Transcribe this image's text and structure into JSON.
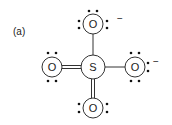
{
  "figure": {
    "label": "(a)",
    "molecule": "sulfate Lewis structure",
    "central_atom": {
      "symbol": "S"
    },
    "atoms": [
      {
        "position": "top",
        "symbol": "O",
        "bond": "single",
        "lone_pair_dots": 6,
        "charge": "−"
      },
      {
        "position": "left",
        "symbol": "O",
        "bond": "double",
        "lone_pair_dots": 4,
        "charge": ""
      },
      {
        "position": "right",
        "symbol": "O",
        "bond": "single",
        "lone_pair_dots": 6,
        "charge": "−"
      },
      {
        "position": "bottom",
        "symbol": "O",
        "bond": "double",
        "lone_pair_dots": 4,
        "charge": ""
      }
    ]
  }
}
